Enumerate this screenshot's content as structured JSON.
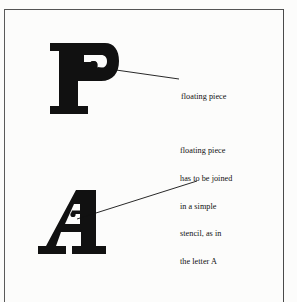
{
  "figure": {
    "background_color": "#fcfcfb",
    "ink_color": "#111111",
    "frame_color": "#545454"
  },
  "letters": [
    {
      "id": "letter-p",
      "character": "P",
      "style": "heavy slab-serif stencil",
      "note": "bowl counter is a separate floating piece"
    },
    {
      "id": "letter-a",
      "character": "A",
      "style": "heavy slab-serif stencil",
      "note": "apex counter joined by a bridge"
    }
  ],
  "annotations": [
    {
      "id": "annotation-floating-piece",
      "lines": [
        "floating piece"
      ],
      "target": "letter-p"
    },
    {
      "id": "annotation-joined-piece",
      "lines": [
        "floating piece",
        "has to be joined",
        "in a simple",
        "stencil, as in",
        "the letter A"
      ],
      "target": "letter-a"
    }
  ]
}
